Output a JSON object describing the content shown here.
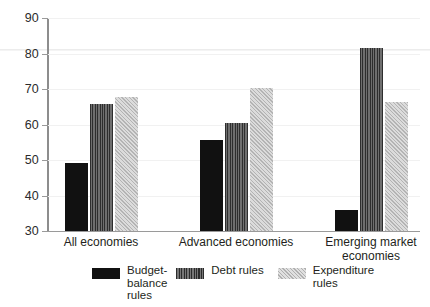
{
  "chart_data": {
    "type": "bar",
    "title": "",
    "subtitle": "",
    "xlabel": "",
    "ylabel": "",
    "ylim": [
      30,
      90
    ],
    "yticks": [
      30,
      40,
      50,
      60,
      70,
      80,
      90
    ],
    "ytick_labels": [
      "30",
      "40",
      "50",
      "60",
      "70",
      "80",
      "90"
    ],
    "grid": true,
    "legend_position": "bottom",
    "categories": [
      "All economies",
      "Advanced economies",
      "Emerging market\neconomies"
    ],
    "series": [
      {
        "name": "Budget-\nbalance\nrules",
        "legend_label": "Budget-\nbalance\nrules",
        "fill": "solid",
        "color": "#111111",
        "values": [
          49,
          55.5,
          35.8
        ]
      },
      {
        "name": "Debt rules",
        "legend_label": "Debt rules",
        "fill": "vertical-stripes",
        "color": "#4a4a4a",
        "values": [
          65.8,
          60.2,
          81.5
        ]
      },
      {
        "name": "Expenditure\nrules",
        "legend_label": "Expenditure\nrules",
        "fill": "diagonal-hatch",
        "color": "#cccccc",
        "values": [
          67.7,
          70.2,
          66.2
        ]
      }
    ]
  },
  "axis": {
    "y_min": 30,
    "y_max": 90,
    "tick_step": 10
  }
}
